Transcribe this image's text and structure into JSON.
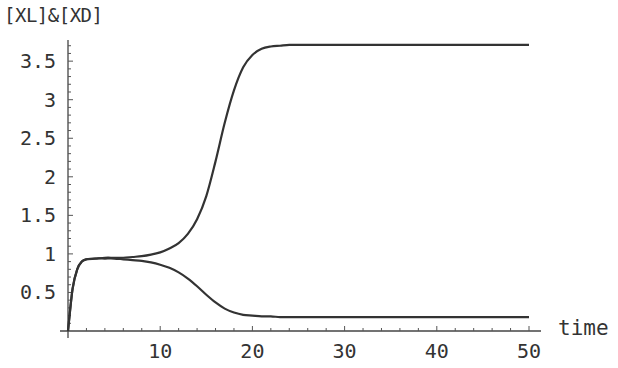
{
  "chart_data": {
    "type": "line",
    "title": "",
    "xlabel": "time",
    "ylabel": "[XL]&[XD]",
    "xlim": [
      0,
      51
    ],
    "ylim": [
      0,
      3.8
    ],
    "grid": false,
    "legend": null,
    "x_ticks": [
      10,
      20,
      30,
      40,
      50
    ],
    "y_ticks": [
      0.5,
      1,
      1.5,
      2,
      2.5,
      3,
      3.5
    ],
    "x_tick_labels": [
      "10",
      "20",
      "30",
      "40",
      "50"
    ],
    "y_tick_labels": [
      "0.5",
      "1",
      "1.5",
      "2",
      "2.5",
      "3",
      "3.5"
    ],
    "x": [
      0,
      0.5,
      1,
      1.5,
      2,
      3,
      4,
      5,
      6,
      7,
      8,
      9,
      10,
      11,
      12,
      13,
      14,
      15,
      16,
      17,
      18,
      19,
      20,
      21,
      22,
      23,
      24,
      25,
      26,
      28,
      30,
      35,
      40,
      45,
      50
    ],
    "series": [
      {
        "name": "XL",
        "values": [
          0,
          0.55,
          0.8,
          0.9,
          0.93,
          0.94,
          0.95,
          0.95,
          0.95,
          0.96,
          0.97,
          0.99,
          1.02,
          1.07,
          1.14,
          1.26,
          1.45,
          1.75,
          2.2,
          2.7,
          3.12,
          3.42,
          3.58,
          3.66,
          3.69,
          3.7,
          3.71,
          3.71,
          3.71,
          3.71,
          3.71,
          3.71,
          3.71,
          3.71,
          3.71
        ]
      },
      {
        "name": "XD",
        "values": [
          0,
          0.55,
          0.8,
          0.9,
          0.93,
          0.94,
          0.94,
          0.94,
          0.93,
          0.92,
          0.91,
          0.89,
          0.86,
          0.82,
          0.76,
          0.68,
          0.58,
          0.47,
          0.37,
          0.29,
          0.24,
          0.21,
          0.2,
          0.19,
          0.19,
          0.18,
          0.18,
          0.18,
          0.18,
          0.18,
          0.18,
          0.18,
          0.18,
          0.18,
          0.18
        ]
      }
    ]
  }
}
